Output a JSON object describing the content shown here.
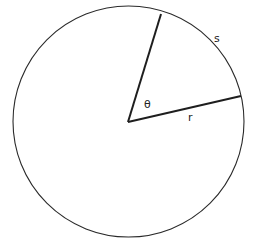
{
  "diagram": {
    "type": "circle-arc-length",
    "labels": {
      "angle": "θ",
      "radius": "r",
      "arc": "s"
    },
    "colors": {
      "stroke": "#2a2a2a",
      "background": "#ffffff"
    }
  }
}
